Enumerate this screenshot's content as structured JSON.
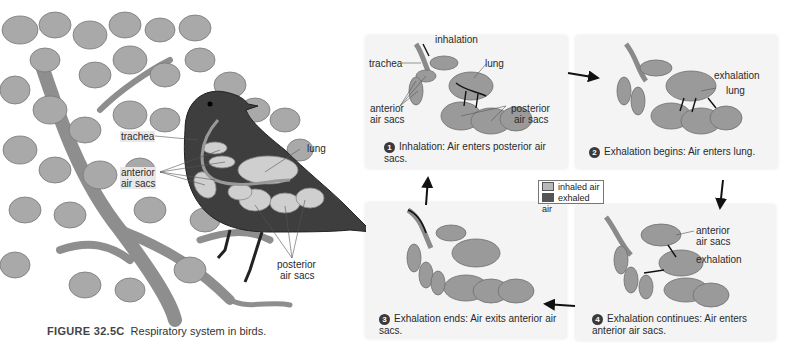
{
  "figure": {
    "number": "FIGURE 32.5C",
    "title": "Respiratory system in birds."
  },
  "bird_illustration": {
    "labels": {
      "trachea": "trachea",
      "anterior_air_sacs_line1": "anterior",
      "anterior_air_sacs_line2": "air sacs",
      "lung": "lung",
      "posterior_air_sacs_line1": "posterior",
      "posterior_air_sacs_line2": "air sacs"
    }
  },
  "legend": {
    "items": [
      {
        "label": "inhaled air",
        "color": "#b8b8b8"
      },
      {
        "label": "exhaled air",
        "color": "#555555"
      }
    ]
  },
  "panels": [
    {
      "step": "1",
      "caption": "Inhalation: Air enters posterior air sacs.",
      "labels": {
        "inhalation": "inhalation",
        "trachea": "trachea",
        "lung": "lung",
        "anterior_1": "anterior",
        "anterior_2": "air sacs",
        "posterior_1": "posterior",
        "posterior_2": "air sacs"
      }
    },
    {
      "step": "2",
      "caption": "Exhalation begins: Air enters lung.",
      "labels": {
        "exhalation": "exhalation",
        "lung": "lung"
      }
    },
    {
      "step": "3",
      "caption": "Exhalation ends: Air exits anterior air sacs.",
      "labels": {}
    },
    {
      "step": "4",
      "caption": "Exhalation continues: Air enters anterior air sacs.",
      "labels": {
        "anterior_1": "anterior",
        "anterior_2": "air sacs",
        "exhalation": "exhalation"
      }
    }
  ],
  "colors": {
    "panel_bg": "#f4f4f4",
    "organ": "#9a9a9a",
    "foliage": "#a8a8a8",
    "bird": "#3c3c3c"
  }
}
